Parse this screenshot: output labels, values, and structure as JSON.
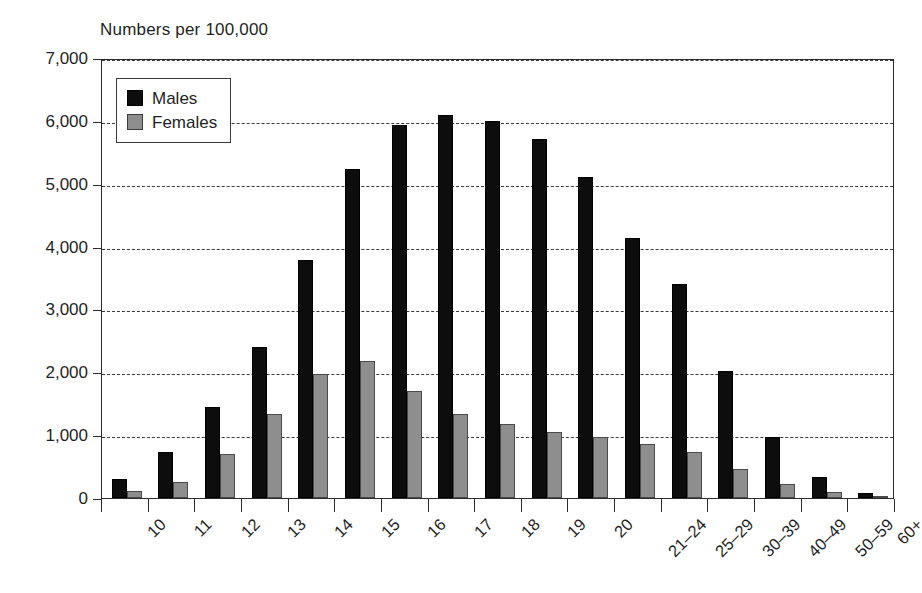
{
  "chart_data": {
    "type": "bar",
    "title": "Numbers per 100,000",
    "xlabel": "",
    "ylabel": "",
    "ylim": [
      0,
      7000
    ],
    "ytick_values": [
      0,
      1000,
      2000,
      3000,
      4000,
      5000,
      6000,
      7000
    ],
    "ytick_labels": [
      "0",
      "1,000",
      "2,000",
      "3,000",
      "4,000",
      "5,000",
      "6,000",
      "7,000"
    ],
    "grid": true,
    "grid_axis": "y",
    "grid_style": "dashed",
    "legend_position": "top-left-inside",
    "categories": [
      "10",
      "11",
      "12",
      "13",
      "14",
      "15",
      "16",
      "17",
      "18",
      "19",
      "20",
      "21–24",
      "25–29",
      "30–39",
      "40–49",
      "50–59",
      "60+"
    ],
    "series": [
      {
        "name": "Males",
        "color": "#0d0d0d",
        "values": [
          300,
          730,
          1450,
          2410,
          3790,
          5230,
          5940,
          6100,
          6000,
          5710,
          5100,
          4130,
          3410,
          2020,
          970,
          340,
          80
        ]
      },
      {
        "name": "Females",
        "color": "#8e8e8e",
        "values": [
          110,
          250,
          700,
          1330,
          1980,
          2180,
          1710,
          1330,
          1180,
          1050,
          970,
          860,
          730,
          460,
          220,
          90,
          30
        ]
      }
    ]
  },
  "legend": {
    "items": [
      {
        "label": "Males",
        "swatch": "male"
      },
      {
        "label": "Females",
        "swatch": "female"
      }
    ]
  }
}
